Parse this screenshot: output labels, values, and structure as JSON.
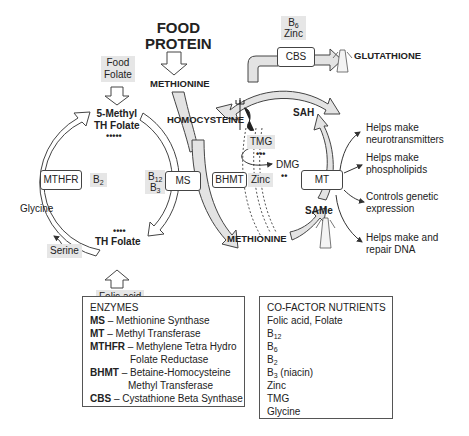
{
  "title": {
    "line1": "FOOD",
    "line2": "PROTEIN"
  },
  "nodes": {
    "methionine_top": "METHIONINE",
    "homocysteine": "HOMOCYSTEINE",
    "sah": "SAH",
    "same": "SAMe",
    "methionine_bottom": "METHIONINE",
    "glutathione": "GLUTATHIONE",
    "methyl_th_folate_1": "5-Methyl",
    "methyl_th_folate_2": "TH Folate",
    "th_folate": "TH Folate",
    "tmg": "TMG",
    "dmg": "DMG",
    "glycine": "Glycine",
    "serine": "Serine"
  },
  "sources": {
    "food_folate_1": "Food",
    "food_folate_2": "Folate",
    "folic_acid": "Folic acid"
  },
  "enzymes_boxes": {
    "mthfr": "MTHFR",
    "ms": "MS",
    "bhmt": "BHMT",
    "mt": "MT",
    "cbs": "CBS"
  },
  "cofactors": {
    "mthfr_b": "B",
    "mthfr_b_sub": "2",
    "ms_b12": "B",
    "ms_b12_sub": "12",
    "ms_b3": "B",
    "ms_b3_sub": "3",
    "bhmt_zinc": "Zinc",
    "cbs_b6": "B",
    "cbs_b6_sub": "6",
    "cbs_zinc": "Zinc"
  },
  "dots": {
    "methyl_folate": "•••••",
    "th_folate": "••••",
    "tmg": "•••",
    "dmg": "••"
  },
  "outcomes": [
    {
      "line1": "Helps make",
      "line2": "neurotransmitters"
    },
    {
      "line1": "Helps make",
      "line2": "phospholipids"
    },
    {
      "line1": "Controls genetic",
      "line2": "expression"
    },
    {
      "line1": "Helps make and",
      "line2": "repair DNA"
    }
  ],
  "legend_enzymes": {
    "title": "ENZYMES",
    "items": [
      {
        "abbr": "MS",
        "text": " – Methionine Synthase"
      },
      {
        "abbr": "MT",
        "text": " – Methyl Transferase"
      },
      {
        "abbr": "MTHFR",
        "text": " – Methylene Tetra Hydro"
      },
      {
        "abbr": "",
        "text": "Folate Reductase"
      },
      {
        "abbr": "BHMT",
        "text": " – Betaine-Homocysteine"
      },
      {
        "abbr": "",
        "text": "Methyl Transferase"
      },
      {
        "abbr": "CBS",
        "text": " – Cystathione Beta Synthase"
      }
    ]
  },
  "legend_cofactors": {
    "title": "CO-FACTOR NUTRIENTS",
    "items": [
      {
        "text": "Folic acid, Folate",
        "sub": "",
        "suffix": ""
      },
      {
        "text": "B",
        "sub": "12",
        "suffix": ""
      },
      {
        "text": "B",
        "sub": "6",
        "suffix": ""
      },
      {
        "text": "B",
        "sub": "2",
        "suffix": ""
      },
      {
        "text": "B",
        "sub": "3",
        "suffix": " (niacin)"
      },
      {
        "text": "Zinc",
        "sub": "",
        "suffix": ""
      },
      {
        "text": "TMG",
        "sub": "",
        "suffix": ""
      },
      {
        "text": "Glycine",
        "sub": "",
        "suffix": ""
      }
    ]
  },
  "colors": {
    "arrow_fill": "#e3e3e3",
    "arrow_stroke": "#444444",
    "shade": "#e6e6e6",
    "text": "#222222"
  }
}
